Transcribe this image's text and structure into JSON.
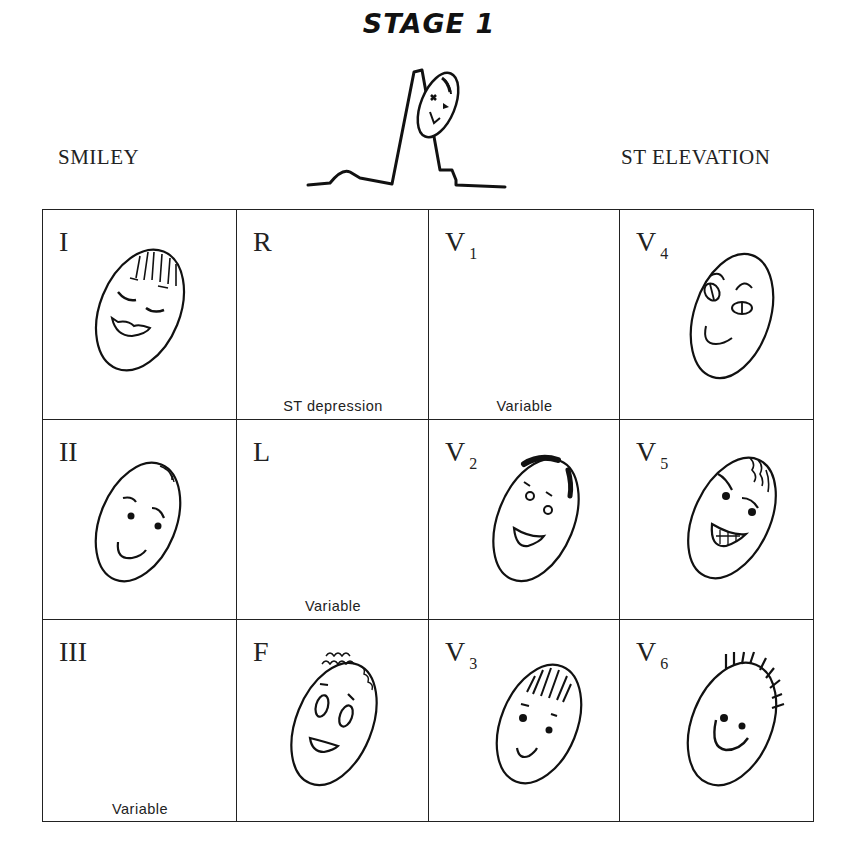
{
  "title": "STAGE 1",
  "header": {
    "left_label": "SMILEY",
    "right_label": "ST ELEVATION"
  },
  "illustration": {
    "description": "ECG waveform with elevated ST segment and a face leaning on the R wave",
    "icon": "ecg-waveform-icon"
  },
  "grid": {
    "rows": 3,
    "cols": 4,
    "cells": [
      {
        "lead": "I",
        "sub": "",
        "note": "",
        "face": "smiling-face-closed-eyes-bangs"
      },
      {
        "lead": "R",
        "sub": "",
        "note": "ST depression",
        "face": ""
      },
      {
        "lead": "V",
        "sub": "1",
        "note": "Variable",
        "face": ""
      },
      {
        "lead": "V",
        "sub": "4",
        "note": "",
        "face": "smiling-face-oval-eyes"
      },
      {
        "lead": "II",
        "sub": "",
        "note": "",
        "face": "smiling-face-dot-eyes"
      },
      {
        "lead": "L",
        "sub": "",
        "note": "Variable",
        "face": ""
      },
      {
        "lead": "V",
        "sub": "2",
        "note": "",
        "face": "grinning-face-curly-hair"
      },
      {
        "lead": "V",
        "sub": "5",
        "note": "",
        "face": "toothy-grin-face"
      },
      {
        "lead": "III",
        "sub": "",
        "note": "Variable",
        "face": ""
      },
      {
        "lead": "F",
        "sub": "",
        "note": "",
        "face": "surprised-face-curly-hair"
      },
      {
        "lead": "V",
        "sub": "3",
        "note": "",
        "face": "smiling-face-striped-hair"
      },
      {
        "lead": "V",
        "sub": "6",
        "note": "",
        "face": "smiling-face-spiky-hair"
      }
    ]
  }
}
